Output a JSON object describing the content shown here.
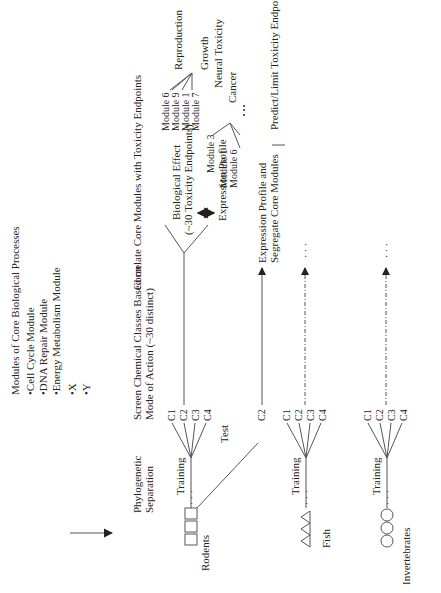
{
  "modules": {
    "title": "Modules of Core Biological Processes",
    "items": [
      "•Cell Cycle Module",
      "•DNA Repair Module",
      "•Energy Metabolism Module",
      "•X",
      "•Y"
    ]
  },
  "steps": {
    "phylogenetic": [
      "Phylogenetic",
      "Separation"
    ],
    "screen": [
      "Screen Chemical Classes Based on",
      "Mode of Action (~30 distinct)"
    ],
    "correlate": "Correlate Core Modules with Toxicity Endpoints"
  },
  "organisms": {
    "rodents": "Rodents",
    "fish": "Fish",
    "invertebrates": "Invertebrates"
  },
  "branch_labels": {
    "training": "Training",
    "test": "Test",
    "classes": [
      "C1",
      "C2",
      "C3",
      "C4"
    ],
    "test_class": "C2"
  },
  "effects": {
    "biological_effect": [
      "Biological Effect",
      "(~30 Toxicity Endpoints)"
    ],
    "expression_profile": "Expression Profile",
    "test_outcome": [
      "Expression Profile and",
      "Segregate Core Modules"
    ],
    "predict": "Predict/Limit Toxicity Endpoints to Evaluate"
  },
  "module_groups": {
    "group1": [
      "Module 6",
      "Module 9",
      "Module 1",
      "Module 7"
    ],
    "group2": [
      "Module 3",
      "Module 1",
      "Module 6"
    ]
  },
  "endpoints": [
    "Reproduction",
    "Growth",
    "Neural Toxicity",
    "Cancer"
  ],
  "ellipsis": "⋮"
}
